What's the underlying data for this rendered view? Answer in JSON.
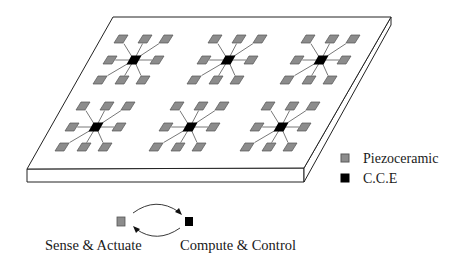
{
  "legend": {
    "items": [
      {
        "label": "Piezoceramic",
        "color": "#8c8c8c",
        "border": "#5a5a5a",
        "symbol": "gray-square"
      },
      {
        "label": "C.C.E",
        "color": "#000000",
        "border": "#000000",
        "symbol": "black-square"
      }
    ]
  },
  "flow": {
    "left_label": "Sense & Actuate",
    "right_label": "Compute & Control",
    "left_color": "#8c8c8c",
    "right_color": "#000000"
  },
  "plate": {
    "fill": "#ffffff",
    "stroke": "#222222",
    "clusters": [
      {
        "id": 1,
        "cx": 134,
        "cy": 60
      },
      {
        "id": 2,
        "cx": 228,
        "cy": 60
      },
      {
        "id": 3,
        "cx": 321,
        "cy": 60
      },
      {
        "id": 4,
        "cx": 96,
        "cy": 127
      },
      {
        "id": 5,
        "cx": 190,
        "cy": 127
      },
      {
        "id": 6,
        "cx": 281,
        "cy": 127
      }
    ],
    "pad_offsets": [
      [
        -13,
        -21
      ],
      [
        11,
        -21
      ],
      [
        32,
        -21
      ],
      [
        -24,
        0
      ],
      [
        23,
        0
      ],
      [
        -34,
        20
      ],
      [
        -12,
        20
      ],
      [
        9,
        20
      ]
    ],
    "pad_color": "#8c8c8c",
    "pad_border": "#555555",
    "cce_color": "#000000",
    "wire_color": "#555555"
  }
}
